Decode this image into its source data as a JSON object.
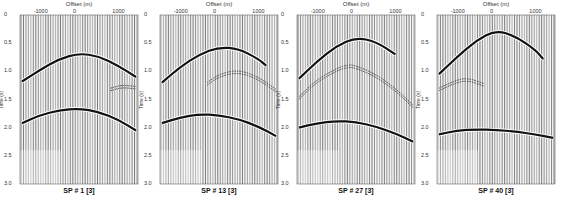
{
  "figure": {
    "x_axis_label": "Offset (m)",
    "y_axis_label": "Time (s)",
    "x_ticks": [
      "-1000",
      "0",
      "1000"
    ],
    "y_ticks": [
      "0",
      "0.5",
      "1.0",
      "1.5",
      "2.0",
      "2.5",
      "3.0"
    ]
  },
  "panels": [
    {
      "caption": "SP # 1  [3]"
    },
    {
      "caption": "SP # 13  [3]"
    },
    {
      "caption": "SP # 27 [3]"
    },
    {
      "caption": "SP # 40 [3]"
    }
  ],
  "chart_data": [
    {
      "type": "line",
      "title": "SP # 1 [3]",
      "xlabel": "Offset (m)",
      "ylabel": "Time (s)",
      "xlim": [
        -1500,
        1500
      ],
      "ylim": [
        3.0,
        0
      ],
      "x_ticks": [
        -1000,
        0,
        1000
      ],
      "y_ticks": [
        0,
        0.5,
        1.0,
        1.5,
        2.0,
        2.5,
        3.0
      ],
      "series": [
        {
          "name": "direct-arrival",
          "x": [
            -1450,
            -1000,
            -500,
            0,
            500,
            1000,
            1450
          ],
          "y": [
            1.18,
            0.98,
            0.78,
            0.68,
            0.73,
            0.9,
            1.1
          ],
          "style": "bold"
        },
        {
          "name": "reflection-1",
          "x": [
            800,
            1100,
            1450
          ],
          "y": [
            1.3,
            1.24,
            1.27
          ],
          "style": "faint"
        },
        {
          "name": "reflection-2",
          "x": [
            -1450,
            -1000,
            -500,
            0,
            500,
            1000,
            1450
          ],
          "y": [
            1.92,
            1.78,
            1.69,
            1.66,
            1.72,
            1.86,
            2.05
          ],
          "style": "bold"
        }
      ]
    },
    {
      "type": "line",
      "title": "SP # 13 [3]",
      "xlabel": "Offset (m)",
      "ylabel": "Time (s)",
      "xlim": [
        -1500,
        1500
      ],
      "ylim": [
        3.0,
        0
      ],
      "x_ticks": [
        -1000,
        0,
        1000
      ],
      "y_ticks": [
        0,
        0.5,
        1.0,
        1.5,
        2.0,
        2.5,
        3.0
      ],
      "series": [
        {
          "name": "direct-arrival",
          "x": [
            -1450,
            -1000,
            -500,
            0,
            500,
            1000,
            1200
          ],
          "y": [
            1.2,
            0.93,
            0.7,
            0.57,
            0.6,
            0.78,
            0.9
          ],
          "style": "bold"
        },
        {
          "name": "reflection-1",
          "x": [
            -300,
            0,
            500,
            1000,
            1450
          ],
          "y": [
            1.2,
            1.05,
            0.97,
            1.1,
            1.32
          ],
          "style": "faint"
        },
        {
          "name": "reflection-2",
          "x": [
            -1450,
            -1000,
            -500,
            0,
            500,
            1000,
            1450
          ],
          "y": [
            1.92,
            1.82,
            1.76,
            1.78,
            1.85,
            1.98,
            2.15
          ],
          "style": "bold"
        }
      ]
    },
    {
      "type": "line",
      "title": "SP # 27 [3]",
      "xlabel": "Offset (m)",
      "ylabel": "Time (s)",
      "xlim": [
        -1500,
        1500
      ],
      "ylim": [
        3.0,
        0
      ],
      "x_ticks": [
        -1000,
        0,
        1000
      ],
      "y_ticks": [
        0,
        0.5,
        1.0,
        1.5,
        2.0,
        2.5,
        3.0
      ],
      "series": [
        {
          "name": "direct-arrival",
          "x": [
            -1450,
            -1000,
            -500,
            0,
            500,
            1000
          ],
          "y": [
            1.13,
            0.83,
            0.55,
            0.4,
            0.47,
            0.7
          ],
          "style": "bold"
        },
        {
          "name": "reflection-1",
          "x": [
            -1450,
            -1000,
            -500,
            -200,
            0,
            500,
            1000,
            1450
          ],
          "y": [
            1.45,
            1.15,
            0.95,
            0.88,
            0.9,
            1.05,
            1.3,
            1.6
          ],
          "style": "faint"
        },
        {
          "name": "reflection-2",
          "x": [
            -1450,
            -1000,
            -500,
            0,
            500,
            1000,
            1450
          ],
          "y": [
            2.0,
            1.92,
            1.88,
            1.9,
            1.98,
            2.1,
            2.25
          ],
          "style": "bold"
        }
      ]
    },
    {
      "type": "line",
      "title": "SP # 40 [3]",
      "xlabel": "Offset (m)",
      "ylabel": "Time (s)",
      "xlim": [
        -1500,
        1500
      ],
      "ylim": [
        3.0,
        0
      ],
      "x_ticks": [
        -1000,
        0,
        1000
      ],
      "y_ticks": [
        0,
        0.5,
        1.0,
        1.5,
        2.0,
        2.5,
        3.0
      ],
      "series": [
        {
          "name": "direct-arrival",
          "x": [
            -1450,
            -1000,
            -500,
            0,
            500,
            1000,
            1200
          ],
          "y": [
            1.05,
            0.75,
            0.45,
            0.27,
            0.38,
            0.62,
            0.78
          ],
          "style": "bold"
        },
        {
          "name": "reflection-1",
          "x": [
            -1450,
            -1000,
            -700,
            -300
          ],
          "y": [
            1.3,
            1.15,
            1.12,
            1.22
          ],
          "style": "faint"
        },
        {
          "name": "reflection-2",
          "x": [
            -1450,
            -1000,
            -500,
            0,
            500,
            1000,
            1450
          ],
          "y": [
            2.12,
            2.05,
            2.03,
            2.04,
            2.07,
            2.12,
            2.18
          ],
          "style": "bold"
        }
      ]
    }
  ]
}
